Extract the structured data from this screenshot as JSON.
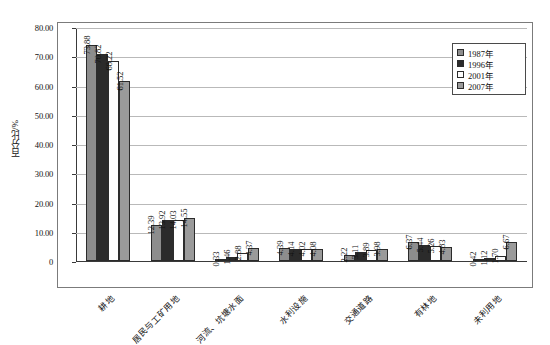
{
  "chart_data": {
    "type": "bar",
    "title": "",
    "xlabel": "",
    "ylabel": "百分比/%",
    "ylim": [
      0,
      80
    ],
    "yticks": [
      "0",
      "10.00",
      "20.00",
      "30.00",
      "40.00",
      "50.00",
      "60.00",
      "70.00",
      "80.00"
    ],
    "grid": true,
    "legend_position": "upper-right",
    "categories": [
      "耕地",
      "居民与工矿用地",
      "河流、坑塘水面",
      "水利设施",
      "交通道路",
      "有林地",
      "未利用地"
    ],
    "series": [
      {
        "name": "1987年",
        "color": "#8d8d8d",
        "values": [
          73.88,
          12.39,
          0.33,
          4.39,
          2.22,
          6.37,
          0.42
        ]
      },
      {
        "name": "1996年",
        "color": "#2b2b2b",
        "values": [
          70.82,
          13.92,
          1.46,
          4.14,
          3.11,
          5.44,
          1.12
        ]
      },
      {
        "name": "2001年",
        "color": "#fdfdfd",
        "values": [
          68.22,
          14.03,
          2.88,
          4.02,
          3.89,
          5.26,
          1.7
        ]
      },
      {
        "name": "2007年",
        "color": "#9a9a9a",
        "values": [
          61.52,
          14.55,
          4.37,
          4.08,
          3.98,
          4.83,
          6.67
        ]
      }
    ],
    "value_labels": [
      [
        "73.88",
        "70.82",
        "68.22",
        "61.52"
      ],
      [
        "12.39",
        "13.92",
        "14.03",
        "14.55"
      ],
      [
        "0.33",
        "1.46",
        "2.88",
        "4.37"
      ],
      [
        "4.39",
        "4.14",
        "4.02",
        "4.08"
      ],
      [
        "2.22",
        "3.11",
        "3.89",
        "3.98"
      ],
      [
        "6.37",
        "5.44",
        "5.26",
        "4.83"
      ],
      [
        "0.42",
        "1.12",
        "1.70",
        "6.67"
      ]
    ]
  }
}
